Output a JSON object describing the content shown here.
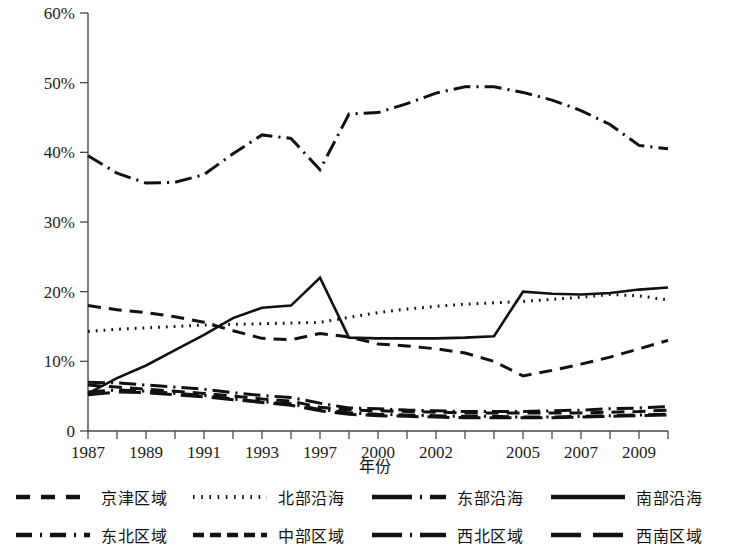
{
  "chart_data": {
    "type": "line",
    "title": "",
    "xlabel": "年份",
    "ylabel": "",
    "ylim": [
      0,
      60
    ],
    "yticks": [
      "0",
      "10%",
      "20%",
      "30%",
      "40%",
      "50%",
      "60%"
    ],
    "ytick_values": [
      0,
      10,
      20,
      30,
      40,
      50,
      60
    ],
    "grid": false,
    "legend_position": "bottom",
    "x": [
      1987,
      1988,
      1989,
      1990,
      1991,
      1992,
      1993,
      1995,
      1997,
      1998,
      2000,
      2001,
      2002,
      2003,
      2004,
      2005,
      2006,
      2007,
      2008,
      2009,
      2010
    ],
    "xtick_labels": [
      "1987",
      "1989",
      "1991",
      "1993",
      "1997",
      "2000",
      "2002",
      "2005",
      "2007",
      "2009"
    ],
    "xtick_values": [
      1987,
      1989,
      1991,
      1993,
      1997,
      2000,
      2002,
      2005,
      2007,
      2009
    ],
    "series": [
      {
        "name": "京津区域",
        "style": "dashed",
        "values": [
          18.0,
          17.4,
          17.0,
          16.4,
          15.6,
          14.4,
          13.3,
          13.1,
          14.0,
          13.5,
          12.5,
          12.2,
          11.8,
          11.2,
          10.0,
          7.9,
          8.7,
          9.6,
          10.6,
          11.8,
          13.0
        ]
      },
      {
        "name": "北部沿海",
        "style": "dotted",
        "values": [
          14.3,
          14.6,
          14.8,
          15.0,
          15.2,
          15.3,
          15.4,
          15.5,
          15.6,
          16.3,
          17.0,
          17.5,
          17.9,
          18.2,
          18.4,
          18.6,
          18.9,
          19.2,
          19.6,
          19.4,
          18.8
        ]
      },
      {
        "name": "东部沿海",
        "style": "dashdot",
        "values": [
          39.5,
          37.0,
          35.6,
          35.7,
          36.8,
          39.8,
          42.5,
          42.0,
          37.5,
          45.5,
          45.7,
          47.0,
          48.5,
          49.4,
          49.4,
          48.6,
          47.5,
          46.0,
          44.0,
          41.0,
          40.5
        ]
      },
      {
        "name": "南部沿海",
        "style": "solid",
        "values": [
          5.4,
          7.6,
          9.4,
          11.6,
          13.8,
          16.2,
          17.7,
          18.0,
          22.0,
          13.4,
          13.3,
          13.3,
          13.3,
          13.4,
          13.6,
          20.0,
          19.7,
          19.6,
          19.8,
          20.3,
          20.6
        ]
      },
      {
        "name": "东北区域",
        "style": "dashdot",
        "values": [
          7.0,
          6.9,
          6.6,
          6.3,
          6.0,
          5.5,
          5.1,
          4.8,
          4.0,
          3.3,
          3.2,
          3.0,
          2.9,
          2.8,
          2.8,
          2.8,
          2.9,
          3.0,
          3.2,
          3.3,
          3.5
        ]
      },
      {
        "name": "中部区域",
        "style": "dashed",
        "values": [
          6.6,
          6.3,
          6.0,
          5.7,
          5.4,
          5.0,
          4.6,
          4.3,
          3.4,
          3.0,
          2.9,
          2.8,
          2.7,
          2.6,
          2.6,
          2.6,
          2.6,
          2.6,
          2.7,
          2.8,
          3.0
        ]
      },
      {
        "name": "西北区域",
        "style": "dashdot",
        "values": [
          5.6,
          5.9,
          5.7,
          5.4,
          5.1,
          4.6,
          4.2,
          3.9,
          3.1,
          2.6,
          2.4,
          2.3,
          2.2,
          2.1,
          2.1,
          2.0,
          2.0,
          2.1,
          2.2,
          2.3,
          2.4
        ]
      },
      {
        "name": "西南区域",
        "style": "longdash",
        "values": [
          5.2,
          5.6,
          5.5,
          5.2,
          4.9,
          4.5,
          4.1,
          3.7,
          2.9,
          2.4,
          2.2,
          2.1,
          2.0,
          1.9,
          1.9,
          1.9,
          1.9,
          2.0,
          2.1,
          2.2,
          2.3
        ]
      }
    ]
  },
  "legend": {
    "rows": [
      [
        {
          "label": "京津区域",
          "style": "dashed"
        },
        {
          "label": "北部沿海",
          "style": "dotted"
        },
        {
          "label": "东部沿海",
          "style": "dashdot"
        },
        {
          "label": "南部沿海",
          "style": "solid"
        }
      ],
      [
        {
          "label": "东北区域",
          "style": "dashdot"
        },
        {
          "label": "中部区域",
          "style": "dashed"
        },
        {
          "label": "西北区域",
          "style": "dashdot"
        },
        {
          "label": "西南区域",
          "style": "longdash"
        }
      ]
    ]
  },
  "colors": {
    "ink": "#111111",
    "axis": "#4a4a4a",
    "background": "#ffffff"
  }
}
